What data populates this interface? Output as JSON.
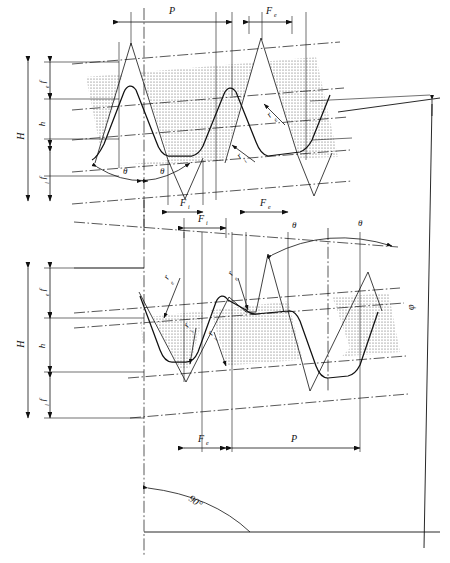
{
  "figure": {
    "type": "engineering-drawing",
    "width": 450,
    "height": 563,
    "line_color": "#111111",
    "hatch_color": "#555555",
    "background": "#ffffff"
  },
  "labels": {
    "height_total": "H",
    "height_middle": "h",
    "flank_upper": "f",
    "flank_upper_sub": "e",
    "flank_lower": "f",
    "flank_lower_sub": "i",
    "pitch": "P",
    "crest_width": "F",
    "crest_width_sub": "e",
    "root_width": "F",
    "root_width_sub": "i",
    "angle_theta": "θ",
    "angle_phi": "φ",
    "angle_right": "90°",
    "radius": "r",
    "radius_crest_sub": "e",
    "radius_root_sub": "i"
  },
  "top_view": {
    "name": "upper-profile-view",
    "dimensions": [
      {
        "id": "P",
        "label": "P",
        "sub": "",
        "kind": "horizontal",
        "description": "pitch across one full tooth"
      },
      {
        "id": "Fe",
        "label": "F",
        "sub": "e",
        "kind": "horizontal",
        "description": "crest flat width"
      },
      {
        "id": "Fi",
        "label": "F",
        "sub": "i",
        "kind": "horizontal",
        "description": "root flat width"
      },
      {
        "id": "H",
        "label": "H",
        "sub": "",
        "kind": "vertical",
        "description": "total profile height"
      },
      {
        "id": "h",
        "label": "h",
        "sub": "",
        "kind": "vertical",
        "description": "working height"
      },
      {
        "id": "fe",
        "label": "f",
        "sub": "e",
        "kind": "vertical",
        "description": "upper truncation"
      },
      {
        "id": "fi",
        "label": "f",
        "sub": "i",
        "kind": "vertical",
        "description": "lower truncation"
      }
    ],
    "angles": [
      {
        "id": "theta-left",
        "label": "θ"
      },
      {
        "id": "theta-right",
        "label": "θ"
      }
    ],
    "radii": [
      {
        "id": "re",
        "label": "r",
        "sub": "e"
      },
      {
        "id": "ri",
        "label": "r",
        "sub": "i"
      }
    ]
  },
  "bottom_view": {
    "name": "lower-profile-view",
    "dimensions": [
      {
        "id": "P",
        "label": "P",
        "sub": "",
        "kind": "horizontal",
        "description": "pitch across one full tooth"
      },
      {
        "id": "Fe",
        "label": "F",
        "sub": "e",
        "kind": "horizontal",
        "description": "crest flat width"
      },
      {
        "id": "Fi",
        "label": "F",
        "sub": "i",
        "kind": "horizontal",
        "description": "root flat width"
      },
      {
        "id": "H",
        "label": "H",
        "sub": "",
        "kind": "vertical",
        "description": "total profile height"
      },
      {
        "id": "h",
        "label": "h",
        "sub": "",
        "kind": "vertical",
        "description": "working height"
      },
      {
        "id": "fe",
        "label": "f",
        "sub": "e",
        "kind": "vertical",
        "description": "upper truncation"
      },
      {
        "id": "fi",
        "label": "f",
        "sub": "i",
        "kind": "vertical",
        "description": "lower truncation"
      }
    ],
    "angles": [
      {
        "id": "theta-left",
        "label": "θ"
      },
      {
        "id": "theta-right",
        "label": "θ"
      }
    ],
    "radii": [
      {
        "id": "re-1",
        "label": "r",
        "sub": "e"
      },
      {
        "id": "re-2",
        "label": "r",
        "sub": "e"
      },
      {
        "id": "ri-1",
        "label": "r",
        "sub": "i"
      },
      {
        "id": "ri-2",
        "label": "r",
        "sub": "i"
      }
    ]
  },
  "global_angles": {
    "taper_angle": {
      "id": "phi",
      "label": "φ",
      "description": "taper half angle at right edge"
    },
    "axis_angle": {
      "id": "90deg",
      "label": "90°",
      "description": "angle from centre axis to base line"
    }
  }
}
